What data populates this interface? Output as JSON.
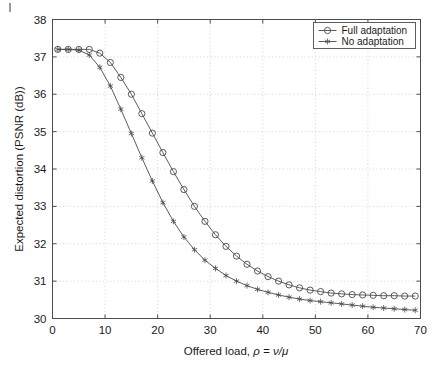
{
  "figure": {
    "background_color": "#ffffff",
    "axis_color": "#4d4d4d",
    "grid_color": "#c8c8c8",
    "series_color": "#4a4a4a"
  },
  "chart_data": {
    "type": "line",
    "title": "",
    "xlabel": "Offered load, ρ = ν/μ",
    "ylabel": "Expected distortion (PSNR (dB))",
    "xlim": [
      0,
      70
    ],
    "ylim": [
      30,
      38
    ],
    "xticks": [
      0,
      10,
      20,
      30,
      40,
      50,
      60,
      70
    ],
    "yticks": [
      30,
      31,
      32,
      33,
      34,
      35,
      36,
      37,
      38
    ],
    "xtick_labels": [
      "0",
      "10",
      "20",
      "30",
      "40",
      "50",
      "60",
      "70"
    ],
    "ytick_labels": [
      "30",
      "31",
      "32",
      "33",
      "34",
      "35",
      "36",
      "37",
      "38"
    ],
    "grid": true,
    "grid_style": "dotted",
    "legend_position": "top-right",
    "series": [
      {
        "name": "Full adaptation",
        "marker": "circle",
        "x": [
          1,
          3,
          5,
          7,
          9,
          11,
          13,
          15,
          17,
          19,
          21,
          23,
          25,
          27,
          29,
          31,
          33,
          35,
          37,
          39,
          41,
          43,
          45,
          47,
          49,
          51,
          53,
          55,
          57,
          59,
          61,
          63,
          65,
          67,
          69
        ],
        "values": [
          37.2,
          37.2,
          37.2,
          37.2,
          37.1,
          36.85,
          36.45,
          36.0,
          35.48,
          34.96,
          34.44,
          33.93,
          33.45,
          33.0,
          32.6,
          32.24,
          31.93,
          31.67,
          31.45,
          31.27,
          31.12,
          31.0,
          30.9,
          30.82,
          30.76,
          30.72,
          30.68,
          30.66,
          30.64,
          30.63,
          30.62,
          30.61,
          30.61,
          30.6,
          30.6
        ]
      },
      {
        "name": "No adaptation",
        "marker": "star",
        "x": [
          1,
          3,
          5,
          7,
          9,
          11,
          13,
          15,
          17,
          19,
          21,
          23,
          25,
          27,
          29,
          31,
          33,
          35,
          37,
          39,
          41,
          43,
          45,
          47,
          49,
          51,
          53,
          55,
          57,
          59,
          61,
          63,
          65,
          67,
          69
        ],
        "values": [
          37.2,
          37.2,
          37.18,
          37.05,
          36.72,
          36.22,
          35.6,
          34.95,
          34.3,
          33.68,
          33.1,
          32.6,
          32.18,
          31.84,
          31.56,
          31.34,
          31.15,
          31.0,
          30.88,
          30.78,
          30.7,
          30.63,
          30.57,
          30.52,
          30.48,
          30.45,
          30.42,
          30.39,
          30.36,
          30.33,
          30.3,
          30.28,
          30.26,
          30.24,
          30.22
        ]
      }
    ]
  },
  "legend": {
    "entries": [
      {
        "label": "Full adaptation",
        "marker": "circle"
      },
      {
        "label": "No adaptation",
        "marker": "star"
      }
    ]
  }
}
